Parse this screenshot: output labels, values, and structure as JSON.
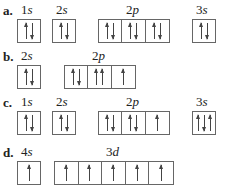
{
  "rows": [
    {
      "label": "a.",
      "orbitals": [
        {
          "n": "1",
          "l": "s",
          "x": 17,
          "cells": [
            [
              "up",
              "down"
            ]
          ]
        },
        {
          "n": "2",
          "l": "s",
          "x": 52,
          "cells": [
            [
              "up",
              "down"
            ]
          ]
        },
        {
          "n": "2",
          "l": "p",
          "x": 98,
          "cells": [
            [
              "up",
              "down"
            ],
            [
              "up",
              "down"
            ],
            [
              "up",
              "down"
            ]
          ]
        },
        {
          "n": "3",
          "l": "s",
          "x": 192,
          "cells": [
            [
              "up",
              "down"
            ]
          ]
        }
      ]
    },
    {
      "label": "b.",
      "orbitals": [
        {
          "n": "2",
          "l": "s",
          "x": 17,
          "cells": [
            [
              "up",
              "down"
            ]
          ]
        },
        {
          "n": "2",
          "l": "p",
          "x": 64,
          "cells": [
            [
              "up",
              "down"
            ],
            [
              "up",
              "up"
            ],
            [
              "up"
            ]
          ]
        }
      ]
    },
    {
      "label": "c.",
      "orbitals": [
        {
          "n": "1",
          "l": "s",
          "x": 17,
          "cells": [
            [
              "up",
              "down"
            ]
          ]
        },
        {
          "n": "2",
          "l": "s",
          "x": 52,
          "cells": [
            [
              "up",
              "down"
            ]
          ]
        },
        {
          "n": "2",
          "l": "p",
          "x": 98,
          "cells": [
            [
              "up",
              "down"
            ],
            [
              "up",
              "down"
            ],
            [
              "up"
            ]
          ]
        },
        {
          "n": "3",
          "l": "s",
          "x": 192,
          "cells": [
            [
              "up",
              "down",
              "up"
            ]
          ]
        }
      ]
    },
    {
      "label": "d.",
      "orbitals": [
        {
          "n": "4",
          "l": "s",
          "x": 17,
          "cells": [
            [
              "up"
            ]
          ]
        },
        {
          "n": "3",
          "l": "d",
          "x": 54,
          "cells": [
            [
              "up"
            ],
            [
              "up"
            ],
            [
              "up"
            ],
            [
              "up"
            ],
            [
              "up"
            ]
          ]
        }
      ]
    }
  ],
  "row_y": [
    0,
    46,
    92,
    142
  ]
}
